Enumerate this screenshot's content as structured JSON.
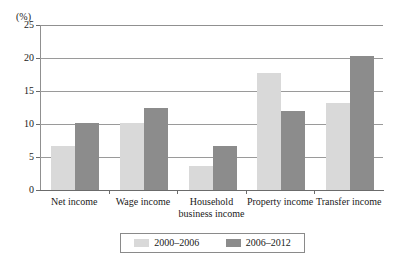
{
  "chart_data": {
    "type": "bar",
    "title": "",
    "subtitle": "",
    "xlabel": "",
    "ylabel": "(%)",
    "unit_label": "(%)",
    "ylim": [
      0,
      25
    ],
    "yticks": [
      0,
      5,
      10,
      15,
      20,
      25
    ],
    "ytick_labels": [
      "0",
      "5",
      "10",
      "15",
      "20",
      "25"
    ],
    "grid": true,
    "grid_axis": "y",
    "legend_position": "bottom",
    "categories": [
      "Net income",
      "Wage income",
      "Household business income",
      "Property income",
      "Transfer income"
    ],
    "category_lines": [
      [
        "Net income"
      ],
      [
        "Wage income"
      ],
      [
        "Household",
        "business income"
      ],
      [
        "Property income"
      ],
      [
        "Transfer income"
      ]
    ],
    "series": [
      {
        "name": "2000–2006",
        "color": "#d9d9d9",
        "values": [
          6.7,
          10.2,
          3.7,
          17.8,
          13.2
        ]
      },
      {
        "name": "2006–2012",
        "color": "#8c8c8c",
        "values": [
          10.2,
          12.5,
          6.7,
          12.0,
          20.3
        ]
      }
    ]
  },
  "legend": {
    "items": [
      {
        "label": "2000–2006",
        "color": "#d9d9d9"
      },
      {
        "label": "2006–2012",
        "color": "#8c8c8c"
      }
    ]
  },
  "colors": {
    "series_light": "#d9d9d9",
    "series_dark": "#8c8c8c",
    "grid": "#9a9a9a",
    "axis": "#6b6b6b",
    "text": "#1a1a1a",
    "background": "#ffffff"
  }
}
